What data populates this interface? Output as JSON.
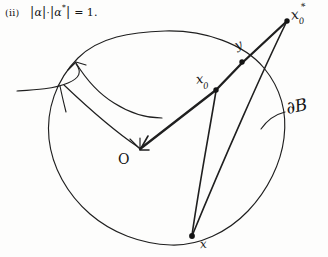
{
  "figure": {
    "kind": "handwritten-geometry-sketch",
    "medium": "pencil on paper",
    "background_color": "#fdfdfc",
    "ink_color": "#141414",
    "width_px": 328,
    "height_px": 257
  },
  "equation": {
    "item_tag": "(ii)",
    "left_bar_1": "|",
    "alpha": "α",
    "right_bar_1": "|",
    "center_dot": "·",
    "left_bar_2": "|",
    "alpha_star_base": "α",
    "alpha_star_mark": "*",
    "right_bar_2": "|",
    "equals": "=",
    "value": "1.",
    "plain_text": "(ii)  |α|·|α*| = 1."
  },
  "labels": {
    "x0_star": {
      "base": "x",
      "sub": "0",
      "sup": "*",
      "text": "x₀*"
    },
    "y": {
      "text": "y"
    },
    "x0": {
      "base": "x",
      "sub": "0",
      "text": "x₀"
    },
    "x": {
      "text": "x"
    },
    "center": {
      "text": "O"
    },
    "boundary": {
      "text": "∂B"
    },
    "leader_tick": {
      "text": "|"
    }
  },
  "geometry": {
    "circle": {
      "name": "ball-B",
      "center_px": [
        166,
        138
      ],
      "radius_x_px": 119,
      "radius_y_px": 107,
      "stroke": "#1f1f1f",
      "closed": true,
      "shape": "slightly-irregular-hand-drawn-oval"
    },
    "points": [
      {
        "id": "O",
        "label": "O",
        "px": [
          140,
          148
        ],
        "marked": "arrow-target"
      },
      {
        "id": "x0",
        "label": "x₀",
        "px": [
          216,
          89
        ],
        "marked": "filled-dot"
      },
      {
        "id": "y",
        "label": "y",
        "px": [
          242,
          62
        ],
        "marked": "filled-dot",
        "on_boundary": true
      },
      {
        "id": "x0_star",
        "label": "x₀*",
        "px": [
          287,
          20
        ],
        "marked": "filled-dot",
        "outside": true
      },
      {
        "id": "x",
        "label": "x",
        "px": [
          191,
          236
        ],
        "marked": "filled-dot",
        "on_boundary": true
      }
    ],
    "segments": [
      {
        "from": "O",
        "to": "x0_star",
        "note": "radial ray through x₀ and y, arrowhead at O"
      },
      {
        "from": "x0",
        "to": "x",
        "note": "chord from x₀ down to boundary point x"
      },
      {
        "from": "x0_star",
        "to": "x",
        "note": "long segment from external point x₀* to x"
      }
    ],
    "leader": {
      "name": "boundary-leader-arrow",
      "from_px": [
        38,
        92
      ],
      "to_px": [
        76,
        63
      ],
      "style": "curved-with-arrowhead",
      "points_to": "circle-boundary"
    },
    "boundary_leader": {
      "name": "dB-leader",
      "from_px": [
        284,
        112
      ],
      "to_px": [
        262,
        128
      ],
      "style": "short-curve"
    }
  }
}
